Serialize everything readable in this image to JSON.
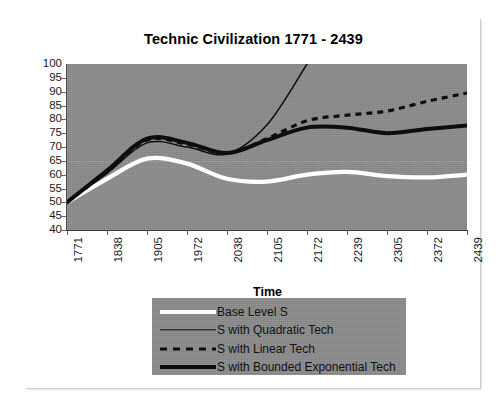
{
  "chart_data": {
    "type": "line",
    "title": "Technic Civilization 1771 - 2439",
    "xlabel": "Time",
    "ylabel": "",
    "ylim": [
      40,
      100
    ],
    "yticks": [
      40,
      45,
      50,
      55,
      60,
      65,
      70,
      75,
      80,
      85,
      90,
      95,
      100
    ],
    "grid": "dotted horizontal gridline at 65",
    "legend_position": "below plot",
    "x": [
      1771,
      1838,
      1905,
      1972,
      2038,
      2105,
      2172,
      2239,
      2305,
      2372,
      2439
    ],
    "categories": [
      "1771",
      "1838",
      "1905",
      "1972",
      "2038",
      "2105",
      "2172",
      "2239",
      "2305",
      "2372",
      "2439"
    ],
    "series": [
      {
        "name": "Base Level S",
        "style": "solid-thick-white",
        "color": "#ffffff",
        "values": [
          50.0,
          58.5,
          65.8,
          64.0,
          58.5,
          57.5,
          60.0,
          61.0,
          59.5,
          59.0,
          60.0
        ]
      },
      {
        "name": "S with Quadratic Tech",
        "style": "solid-thin-black",
        "color": "#0d0d0d",
        "truncated_at_top": true,
        "values": [
          50.0,
          60.5,
          71.5,
          70.0,
          67.5,
          78.0,
          100.0,
          null,
          null,
          null,
          null
        ]
      },
      {
        "name": "S with Linear Tech",
        "style": "dashed-black",
        "color": "#0d0d0d",
        "values": [
          50.0,
          61.0,
          72.5,
          71.0,
          67.8,
          73.0,
          79.5,
          81.5,
          83.0,
          86.5,
          89.5
        ]
      },
      {
        "name": "S with Bounded Exponential Tech",
        "style": "solid-thick-black",
        "color": "#0d0d0d",
        "values": [
          50.0,
          61.5,
          73.0,
          71.5,
          67.8,
          72.5,
          77.0,
          77.0,
          75.0,
          76.5,
          77.8
        ]
      }
    ]
  },
  "legend": {
    "items": [
      {
        "label": "Base Level S"
      },
      {
        "label": "S with Quadratic Tech"
      },
      {
        "label": "S with Linear Tech"
      },
      {
        "label": "S with Bounded Exponential Tech"
      }
    ]
  },
  "colors": {
    "plot_background": "#8b8b8b",
    "page_background": "#ffffff",
    "line_black": "#0d0d0d",
    "line_white": "#ffffff",
    "axis": "#4a4a4a",
    "text": "#111111"
  }
}
